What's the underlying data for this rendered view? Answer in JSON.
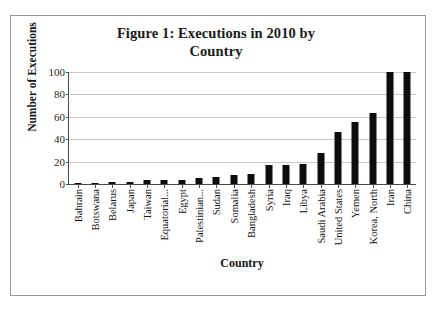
{
  "chart_data": {
    "type": "bar",
    "title": "Figure 1: Executions in 2010 by Country",
    "title_line1": "Figure 1: Executions in 2010 by",
    "title_line2": "Country",
    "xlabel": "Country",
    "ylabel": "Number of Executions",
    "ylim": [
      0,
      100
    ],
    "yticks": [
      0,
      20,
      40,
      60,
      80,
      100
    ],
    "ytick_labels": [
      "0",
      "20",
      "40",
      "60",
      "80",
      "100"
    ],
    "grid": true,
    "legend": "none",
    "bar_color": "#0d0d0d",
    "categories": [
      "Bahrain",
      "Botswana",
      "Belarus",
      "Japan",
      "Taiwan",
      "Equatorial...",
      "Egypt",
      "Palestinian...",
      "Sudan",
      "Somalia",
      "Bangladesh",
      "Syria",
      "Iraq",
      "Libya",
      "Saudi Arabia",
      "United States",
      "Yemen",
      "Korea, North",
      "Iran",
      "China"
    ],
    "values": [
      1,
      1,
      2,
      2,
      4,
      4,
      4,
      5,
      6,
      8,
      9,
      17,
      17,
      18,
      28,
      46,
      55,
      63,
      100,
      100
    ]
  }
}
